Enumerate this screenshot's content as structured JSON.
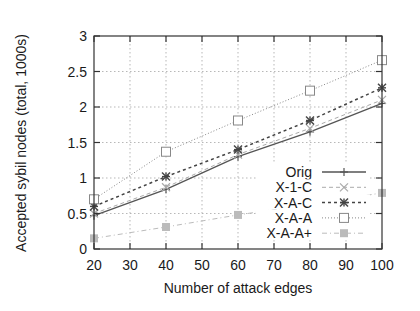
{
  "chart_data": {
    "type": "line",
    "title": "",
    "xlabel": "Number of attack edges",
    "ylabel": "Accepted sybil nodes (total, 1000s)",
    "xlim": [
      20,
      100
    ],
    "ylim": [
      0,
      3
    ],
    "xticks": [
      20,
      30,
      40,
      50,
      60,
      70,
      80,
      90,
      100
    ],
    "yticks": [
      0,
      0.5,
      1,
      1.5,
      2,
      2.5,
      3
    ],
    "xtick_labels": [
      "20",
      "30",
      "40",
      "50",
      "60",
      "70",
      "80",
      "90",
      "100"
    ],
    "ytick_labels": [
      "0",
      "0.5",
      "1",
      "1.5",
      "2",
      "2.5",
      "3"
    ],
    "grid": true,
    "legend_position": "bottom-right",
    "x": [
      20,
      40,
      60,
      80,
      100
    ],
    "series": [
      {
        "name": "Orig",
        "values": [
          0.47,
          0.84,
          1.3,
          1.65,
          2.05
        ],
        "color": "#555555",
        "dash": "solid",
        "marker": "plus"
      },
      {
        "name": "X-1-C",
        "values": [
          0.5,
          0.87,
          1.33,
          1.7,
          2.1
        ],
        "color": "#aaaaaa",
        "dash": "dashed",
        "marker": "cross"
      },
      {
        "name": "X-A-C",
        "values": [
          0.6,
          1.02,
          1.4,
          1.81,
          2.27
        ],
        "color": "#444444",
        "dash": "dotted",
        "marker": "star"
      },
      {
        "name": "X-A-A",
        "values": [
          0.7,
          1.37,
          1.81,
          2.23,
          2.66
        ],
        "color": "#888888",
        "dash": "fine-dot",
        "marker": "open-square"
      },
      {
        "name": "X-A-A+",
        "values": [
          0.15,
          0.31,
          0.48,
          0.63,
          0.79
        ],
        "color": "#bbbbbb",
        "dash": "dash-dot",
        "marker": "filled-square"
      }
    ]
  }
}
